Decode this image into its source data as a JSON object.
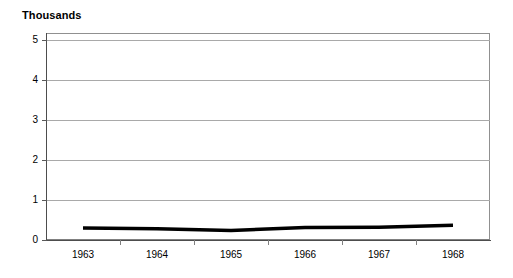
{
  "chart_data": {
    "type": "line",
    "title": "Thousands",
    "xlabel": "",
    "ylabel": "",
    "categories": [
      "1963",
      "1964",
      "1965",
      "1966",
      "1967",
      "1968"
    ],
    "series": [
      {
        "name": "series-1",
        "values": [
          0.3,
          0.28,
          0.24,
          0.31,
          0.32,
          0.37
        ],
        "color": "#000000",
        "line_width": 3.5
      }
    ],
    "ylim": [
      0,
      5
    ],
    "yticks": [
      0,
      1,
      2,
      3,
      4,
      5
    ],
    "ytick_labels": [
      "0",
      "1",
      "2",
      "3",
      "4",
      "5"
    ],
    "grid": "horizontal",
    "legend": "none",
    "plot_background": "#ffffff",
    "grid_color": "#a9a9a9",
    "axis_color": "#4d4d4d"
  },
  "axis": {
    "y_labels": [
      "5",
      "4",
      "3",
      "2",
      "1",
      "0"
    ],
    "x_labels": [
      "1963",
      "1964",
      "1965",
      "1966",
      "1967",
      "1968"
    ]
  }
}
